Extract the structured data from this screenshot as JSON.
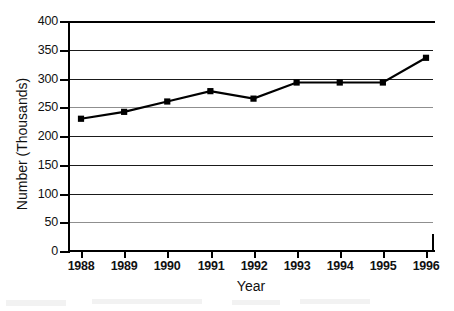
{
  "chart_data": {
    "type": "line",
    "title": "",
    "xlabel": "Year",
    "ylabel": "Number (Thousands)",
    "categories": [
      "1988",
      "1989",
      "1990",
      "1991",
      "1992",
      "1993",
      "1994",
      "1995",
      "1996"
    ],
    "values": [
      230,
      242,
      260,
      278,
      265,
      293,
      293,
      293,
      336
    ],
    "series": [
      {
        "name": "Number (Thousands)",
        "values": [
          230,
          242,
          260,
          278,
          265,
          293,
          293,
          293,
          336
        ]
      }
    ],
    "ylim": [
      0,
      400
    ],
    "yticks": [
      "0",
      "50",
      "100",
      "150",
      "200",
      "250",
      "300",
      "350",
      "400"
    ],
    "ytick_values": [
      0,
      50,
      100,
      150,
      200,
      250,
      300,
      350,
      400
    ],
    "xticks": [
      "1988",
      "1989",
      "1990",
      "1991",
      "1992",
      "1993",
      "1994",
      "1995",
      "1996"
    ],
    "grid": "horizontal",
    "legend": "none",
    "marker": "square",
    "line_color": "#000000",
    "marker_color": "#000000",
    "grid_color": "#1a1a1a",
    "background_color": "#ffffff"
  },
  "axes": {
    "y_title": "Number (Thousands)",
    "x_title": "Year"
  }
}
